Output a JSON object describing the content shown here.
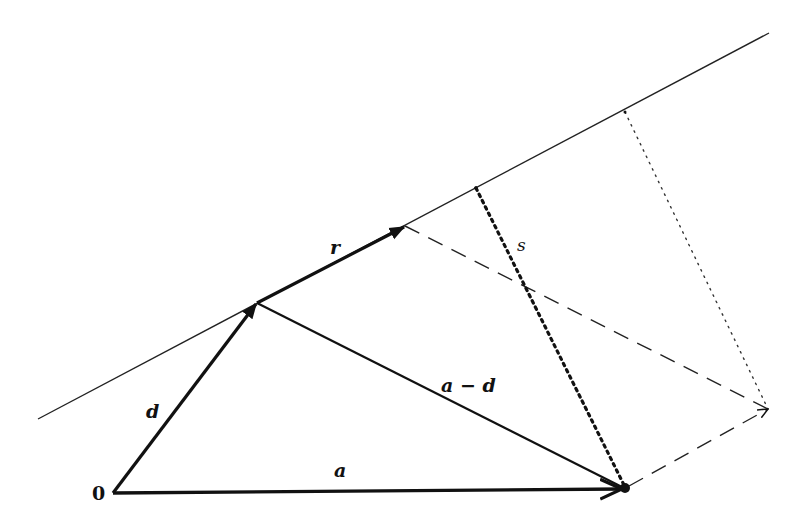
{
  "diagram": {
    "colors": {
      "stroke": "#111111",
      "background": "#ffffff"
    },
    "labels": {
      "origin": "0",
      "d": "d",
      "r": "r",
      "s": "s",
      "a_minus_d": "a − d",
      "a": "a"
    },
    "points": {
      "origin": [
        113,
        493
      ],
      "d_tip": [
        257,
        303
      ],
      "r_tip": [
        405,
        226
      ],
      "a_tip": [
        625,
        489
      ],
      "s_foot": [
        476,
        188
      ],
      "proj_top": [
        625,
        112
      ],
      "parallelogram_corner": [
        768,
        409
      ],
      "line_start": [
        38,
        419
      ],
      "line_end": [
        769,
        33
      ]
    },
    "elements": [
      {
        "id": "line",
        "style": "solid-thin",
        "desc": "line through d in direction r"
      },
      {
        "id": "vector-d",
        "style": "solid-thick-arrow",
        "from": "origin",
        "to": "d_tip"
      },
      {
        "id": "vector-r",
        "style": "solid-thick-arrow",
        "from": "d_tip",
        "to": "r_tip"
      },
      {
        "id": "vector-a",
        "style": "solid-thick-arrow",
        "from": "origin",
        "to": "a_tip"
      },
      {
        "id": "vector-a-minus-d",
        "style": "solid-medium",
        "from": "d_tip",
        "to": "a_tip"
      },
      {
        "id": "segment-s",
        "style": "dotted-thick",
        "from": "s_foot",
        "to": "a_tip"
      },
      {
        "id": "dashed-r-extension",
        "style": "dashed",
        "from": "r_tip",
        "to": "parallelogram_corner"
      },
      {
        "id": "dashed-a-extension",
        "style": "dashed-arrow",
        "from": "a_tip",
        "to": "parallelogram_corner"
      },
      {
        "id": "dotted-thin-projection",
        "style": "dotted-thin",
        "from": "proj_top",
        "to": "parallelogram_corner"
      }
    ]
  }
}
